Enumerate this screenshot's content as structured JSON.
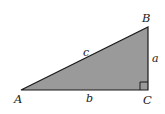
{
  "diagram": {
    "type": "right-triangle",
    "fill_color": "#9a9a9a",
    "stroke_color": "#1a1a1a",
    "right_angle_at": "C",
    "vertices": {
      "A": {
        "label": "A",
        "x": 21,
        "y": 90
      },
      "B": {
        "label": "B",
        "x": 148,
        "y": 27
      },
      "C": {
        "label": "C",
        "x": 148,
        "y": 90
      }
    },
    "sides": {
      "a": {
        "label": "a",
        "between": "B-C"
      },
      "b": {
        "label": "b",
        "between": "A-C"
      },
      "c": {
        "label": "c",
        "between": "A-B"
      }
    }
  }
}
